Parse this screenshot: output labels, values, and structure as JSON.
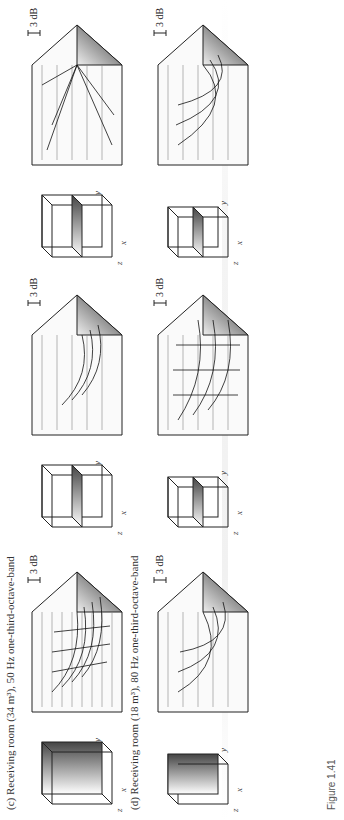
{
  "figure": {
    "label": "Figure 1.41"
  },
  "rows": [
    {
      "caption": "(c) Receiving room (34 m³), 50 Hz one-third-octave-band",
      "panels": [
        {
          "room_axes": {
            "x": "x",
            "y": "y",
            "z": "z"
          },
          "plane": "vertical-back",
          "scale_label": "3 dB"
        },
        {
          "room_axes": {
            "x": "x",
            "y": "y",
            "z": "z"
          },
          "plane": "horizontal-mid",
          "scale_label": "3 dB"
        },
        {
          "room_axes": {
            "x": "x",
            "y": "y",
            "z": "z"
          },
          "plane": "vertical-mid",
          "scale_label": "3 dB"
        }
      ]
    },
    {
      "caption": "(d) Receiving room (18 m³), 80 Hz one-third-octave-band",
      "panels": [
        {
          "room_axes": {
            "x": "x",
            "y": "y",
            "z": "z"
          },
          "plane": "vertical-back",
          "scale_label": "3 dB"
        },
        {
          "room_axes": {
            "x": "x",
            "y": "y",
            "z": "z"
          },
          "plane": "horizontal-mid",
          "scale_label": "3 dB"
        },
        {
          "room_axes": {
            "x": "x",
            "y": "y",
            "z": "z"
          },
          "plane": "vertical-mid",
          "scale_label": "3 dB"
        }
      ]
    }
  ]
}
